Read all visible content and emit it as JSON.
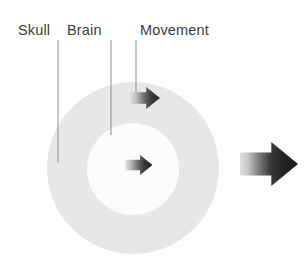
{
  "figure": {
    "type": "anatomical-diagram",
    "background_color": "#ffffff"
  },
  "labels": [
    {
      "id": "skull",
      "text": "Skull",
      "text_x": 18,
      "text_y": 35,
      "leader_x": 58,
      "leader_y_start": 40,
      "leader_y_end": 163,
      "color": "#3c3c3c"
    },
    {
      "id": "brain",
      "text": "Brain",
      "text_x": 67,
      "text_y": 35,
      "leader_x": 111,
      "leader_y_start": 40,
      "leader_y_end": 135,
      "color": "#3c3c3c"
    },
    {
      "id": "movement",
      "text": "Movement",
      "text_x": 140,
      "text_y": 35,
      "leader_x": 136,
      "leader_y_start": 40,
      "leader_y_end": 93,
      "color": "#3c3c3c"
    }
  ],
  "leader_line": {
    "color": "#8c8c8c",
    "width": 1
  },
  "shapes": {
    "skull_ring": {
      "name": "outer-circle-skull",
      "cx": 133,
      "cy": 168,
      "r": 86,
      "fill": "#e7e7e7"
    },
    "brain_core": {
      "name": "inner-circle-brain",
      "cx": 133,
      "cy": 169,
      "r": 46,
      "fill": "#fbfbfb"
    }
  },
  "arrows": [
    {
      "id": "movement-arrow-top",
      "label": "movement-arrow-skull-edge",
      "cx": 145,
      "cy": 98,
      "length": 30,
      "height": 22,
      "gradient_from": "#d8d8d8",
      "gradient_to": "#2d2d2d"
    },
    {
      "id": "movement-arrow-center",
      "label": "movement-arrow-brain-center",
      "cx": 139,
      "cy": 165,
      "length": 27,
      "height": 20,
      "gradient_from": "#d8d8d8",
      "gradient_to": "#2d2d2d"
    },
    {
      "id": "direction-arrow-large",
      "label": "overall-direction-arrow",
      "cx": 269,
      "cy": 164,
      "length": 58,
      "height": 44,
      "gradient_from": "#dcdcdc",
      "gradient_to": "#1f1f1f"
    }
  ],
  "colors": {
    "page_background": "#ffffff",
    "skull_gray": "#e7e7e7",
    "brain_white": "#fbfbfb",
    "label_gray": "#3c3c3c",
    "leader_gray": "#8c8c8c",
    "arrow_dark": "#2d2d2d"
  }
}
